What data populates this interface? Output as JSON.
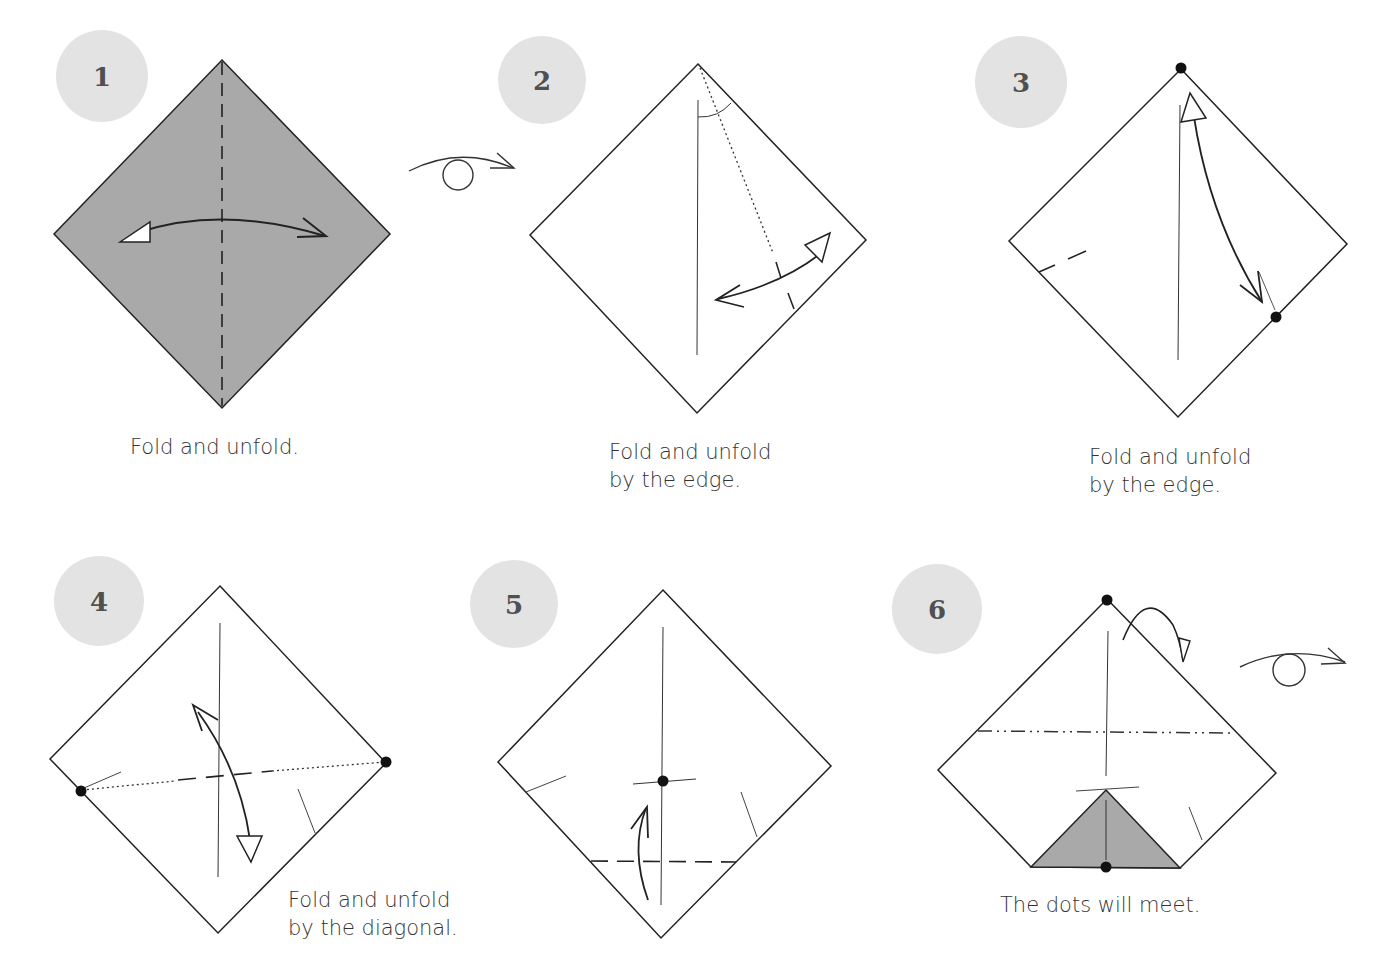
{
  "colors": {
    "badge_fill": "#e3e3e3",
    "paper_colored": "#a9a9a9",
    "paper_white": "#ffffff",
    "line": "#222222"
  },
  "steps": [
    {
      "number": "1",
      "caption": [
        "Fold and unfold."
      ]
    },
    {
      "number": "2",
      "caption": [
        "Fold and unfold",
        "by the edge."
      ]
    },
    {
      "number": "3",
      "caption": [
        "Fold and unfold",
        "by the edge."
      ]
    },
    {
      "number": "4",
      "caption": [
        "Fold and unfold",
        "by the diagonal."
      ]
    },
    {
      "number": "5",
      "caption": []
    },
    {
      "number": "6",
      "caption": [
        "The dots will meet."
      ]
    }
  ],
  "symbols": {
    "turn_over_1": "turn-over-icon",
    "turn_over_2": "turn-over-icon"
  }
}
